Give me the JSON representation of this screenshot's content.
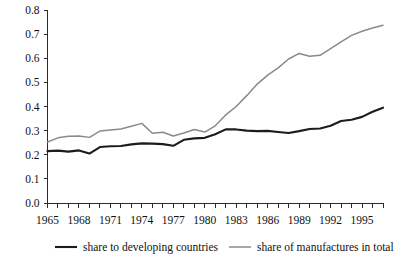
{
  "chart_data": {
    "type": "line",
    "title": "",
    "subtitle": "",
    "xlabel": "",
    "ylabel": "",
    "xlim": [
      1965,
      1997
    ],
    "ylim": [
      0.0,
      0.8
    ],
    "grid": false,
    "legend_position": "bottom",
    "x": [
      1965,
      1966,
      1967,
      1968,
      1969,
      1970,
      1971,
      1972,
      1973,
      1974,
      1975,
      1976,
      1977,
      1978,
      1979,
      1980,
      1981,
      1982,
      1983,
      1984,
      1985,
      1986,
      1987,
      1988,
      1989,
      1990,
      1991,
      1992,
      1993,
      1994,
      1995,
      1996,
      1997
    ],
    "x_tick_labels": [
      "1965",
      "1968",
      "1971",
      "1974",
      "1977",
      "1980",
      "1983",
      "1986",
      "1989",
      "1992",
      "1995"
    ],
    "x_tick_values": [
      1965,
      1968,
      1971,
      1974,
      1977,
      1980,
      1983,
      1986,
      1989,
      1992,
      1995
    ],
    "y_tick_labels": [
      "0.0",
      "0.1",
      "0.2",
      "0.3",
      "0.4",
      "0.5",
      "0.6",
      "0.7",
      "0.8"
    ],
    "y_tick_values": [
      0.0,
      0.1,
      0.2,
      0.3,
      0.4,
      0.5,
      0.6,
      0.7,
      0.8
    ],
    "series": [
      {
        "name": "share to developing countries",
        "color": "#1c1c1c",
        "width": 2.1,
        "values": [
          0.215,
          0.217,
          0.213,
          0.218,
          0.205,
          0.232,
          0.235,
          0.236,
          0.243,
          0.247,
          0.246,
          0.244,
          0.237,
          0.262,
          0.268,
          0.27,
          0.285,
          0.305,
          0.305,
          0.3,
          0.298,
          0.299,
          0.294,
          0.29,
          0.298,
          0.307,
          0.309,
          0.32,
          0.34,
          0.345,
          0.357,
          0.378,
          0.395
        ]
      },
      {
        "name": "share of manufactures in total",
        "color": "#8a8a8a",
        "width": 1.5,
        "values": [
          0.253,
          0.27,
          0.277,
          0.278,
          0.272,
          0.298,
          0.303,
          0.307,
          0.318,
          0.33,
          0.289,
          0.293,
          0.278,
          0.29,
          0.305,
          0.294,
          0.32,
          0.365,
          0.4,
          0.445,
          0.493,
          0.53,
          0.56,
          0.597,
          0.62,
          0.608,
          0.612,
          0.64,
          0.668,
          0.695,
          0.712,
          0.725,
          0.737
        ]
      }
    ],
    "legend": [
      {
        "label": "share to developing countries",
        "color": "#1c1c1c",
        "width": 2.1
      },
      {
        "label": "share of manufactures in total",
        "color": "#8a8a8a",
        "width": 1.5
      }
    ]
  }
}
